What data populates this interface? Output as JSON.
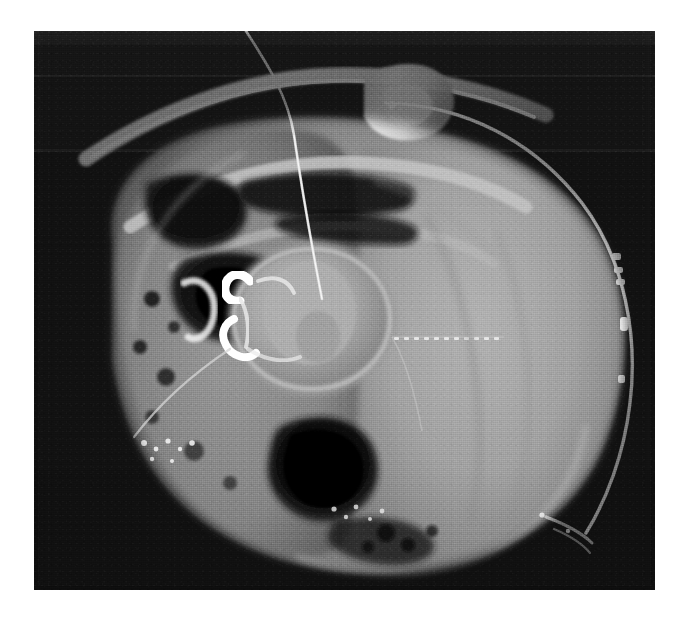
{
  "image": {
    "kind": "radiograph",
    "modality_note": "grayscale cross-sectional radiographic specimen image",
    "canvas": {
      "width": 687,
      "height": 623
    },
    "page_background_color": "#ffffff",
    "plate": {
      "x": 34,
      "y": 31,
      "width": 621,
      "height": 559,
      "background_color": "#151515",
      "exposure_band_colors": [
        "#2a2a2a",
        "#1d1d1d",
        "#343434",
        "#1a1a1a",
        "#2e2e2e",
        "#121212"
      ]
    },
    "tone_palette": {
      "background_dark": "#151515",
      "air_black": "#0b0b0b",
      "soft_tissue_mid": "#8d8d8d",
      "soft_tissue_light": "#a6a6a6",
      "fat_gray": "#6f6f6f",
      "bone_bright": "#d9d9d9",
      "metal_white": "#fdfdfd",
      "calcification": "#efefef"
    },
    "features": [
      {
        "name": "specimen-mass",
        "label": "large ovoid soft-tissue specimen",
        "description": "rounded mass occupying most of the plate, brighter on the right half"
      },
      {
        "name": "bone-arc-upper",
        "label": "curved bony rib-like arc, upper left",
        "description": "bright elongated sweeping arc across the top-left"
      },
      {
        "name": "bone-block-upper-right",
        "label": "bony fragment, upper right",
        "description": "irregular bright nodular bone near the top-right of the arc"
      },
      {
        "name": "central-ring-structure",
        "label": "central ring / vertebral-like body",
        "description": "rounded ring-shaped structure at the center with brighter cortical rim"
      },
      {
        "name": "metal-clip",
        "label": "radiopaque metallic clip",
        "description": "bright hook-shaped high-density clip at the left of the central ring"
      },
      {
        "name": "catheter-line",
        "label": "catheter / drain tube with radiopaque stripe",
        "description": "thin bright line arcing from the top center along the right margin"
      },
      {
        "name": "catheter-markers",
        "label": "radiopaque catheter markers",
        "description": "three short bright marker bands along the right-side catheter"
      },
      {
        "name": "guidewire",
        "label": "thin guidewire extending beyond the top edge",
        "description": "fine bright filament rising from the specimen through the upper dark field"
      },
      {
        "name": "staple-line",
        "label": "dotted surgical staple line",
        "description": "horizontal dashed row of small bright dots in the right upper quadrant"
      },
      {
        "name": "gas-cavity-lower",
        "label": "dark gas-filled cavity",
        "description": "oval black lucency in the lower-central region"
      },
      {
        "name": "gas-cavity-upper-left",
        "label": "dark lucency, upper left quadrant",
        "description": "irregular black region bounded by bright bony margins"
      },
      {
        "name": "speckled-calcification",
        "label": "clustered punctate calcifications",
        "description": "scattered bright specks along the lower margin of the specimen"
      },
      {
        "name": "marginal-calcification-lower-right",
        "label": "linear bright calcification at lower-right border",
        "description": "short bright streaks following the right inferior contour"
      }
    ]
  }
}
